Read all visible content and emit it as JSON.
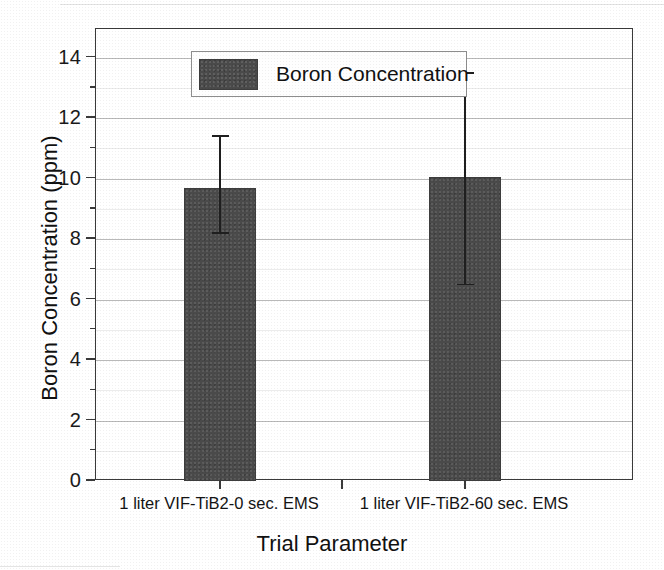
{
  "chart_data": {
    "type": "bar",
    "title": "",
    "xlabel": "Trial Parameter",
    "ylabel": "Boron Concentration (ppm)",
    "categories": [
      "1 liter VIF-TiB2-0 sec. EMS",
      "1 liter VIF-TiB2-60 sec. EMS"
    ],
    "values": [
      9.7,
      10.05
    ],
    "errors_low": [
      8.2,
      6.5
    ],
    "errors_high": [
      11.4,
      13.5
    ],
    "series": [
      {
        "name": "Boron Concentration",
        "values": [
          9.7,
          10.05
        ],
        "errors_low": [
          8.2,
          6.5
        ],
        "errors_high": [
          11.4,
          13.5
        ],
        "color": "#4a4a4a"
      }
    ],
    "ylim": [
      0,
      14.95
    ],
    "ytick_values": [
      0,
      2,
      4,
      6,
      8,
      10,
      12,
      14
    ],
    "ytick_labels": [
      "0",
      "2",
      "4",
      "6",
      "8",
      "10",
      "12",
      "14"
    ],
    "yminor_values": [
      1,
      3,
      5,
      7,
      9,
      11,
      13
    ],
    "grid": "horizontal-major",
    "legend_position": "top-left-inside",
    "legend_entries": [
      "Boron Concentration"
    ]
  },
  "axes": {
    "y_title": "Boron Concentration (ppm)",
    "x_title": "Trial Parameter"
  },
  "legend": {
    "entry_label": "Boron Concentration",
    "swatch_color": "#4a4a4a"
  },
  "colors": {
    "bar_fill": "#4a4a4a",
    "frame": "#3a3a3a",
    "gridline": "#b9b9b9",
    "error_bar": "#1f1f1f",
    "text": "#111111",
    "background": "#ffffff"
  }
}
